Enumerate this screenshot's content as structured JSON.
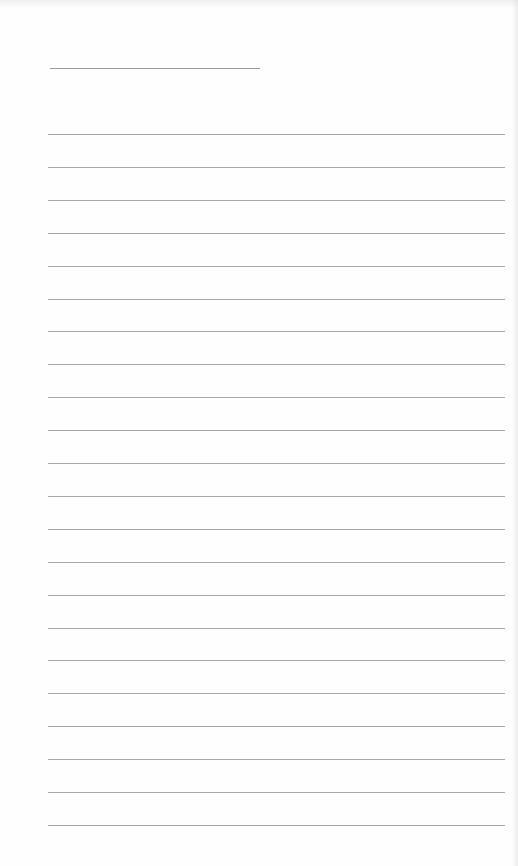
{
  "document": {
    "type": "ruled-page",
    "title_line": {
      "filled_text": ""
    },
    "ruled_lines": [
      {
        "text": ""
      },
      {
        "text": ""
      },
      {
        "text": ""
      },
      {
        "text": ""
      },
      {
        "text": ""
      },
      {
        "text": ""
      },
      {
        "text": ""
      },
      {
        "text": ""
      },
      {
        "text": ""
      },
      {
        "text": ""
      },
      {
        "text": ""
      },
      {
        "text": ""
      },
      {
        "text": ""
      },
      {
        "text": ""
      },
      {
        "text": ""
      },
      {
        "text": ""
      },
      {
        "text": ""
      },
      {
        "text": ""
      },
      {
        "text": ""
      },
      {
        "text": ""
      },
      {
        "text": ""
      },
      {
        "text": ""
      }
    ],
    "colors": {
      "paper": "#fefefe",
      "rule": "#a8a8a8"
    }
  }
}
